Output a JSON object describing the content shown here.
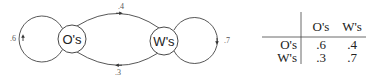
{
  "diagram": {
    "nodes": [
      {
        "id": "O",
        "label": "O's"
      },
      {
        "id": "W",
        "label": "W's"
      }
    ],
    "edges": [
      {
        "from": "O",
        "to": "O",
        "label": ".6"
      },
      {
        "from": "O",
        "to": "W",
        "label": ".4"
      },
      {
        "from": "W",
        "to": "O",
        "label": ".3"
      },
      {
        "from": "W",
        "to": "W",
        "label": ".7"
      }
    ]
  },
  "table": {
    "col_headers": [
      "O's",
      "W's"
    ],
    "rows": [
      {
        "label": "O's",
        "values": [
          ".6",
          ".4"
        ]
      },
      {
        "label": "W's",
        "values": [
          ".3",
          ".7"
        ]
      }
    ]
  },
  "colors": {
    "stroke": "#333333",
    "text": "#222222",
    "edge_label": "#555555"
  }
}
